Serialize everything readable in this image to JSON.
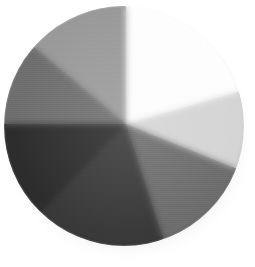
{
  "image": {
    "title": "Conical gradient disc",
    "description": "A circular disc filled with an angular (conic) gradient made of seven gray sectors converging at a point slightly above and left of center, with a soft drop shadow.",
    "background_color": "#ffffff",
    "width": 255,
    "height": 267
  },
  "disc": {
    "label": "gradient-disc",
    "center_x": 126,
    "center_y": 124,
    "radius": 120,
    "shadow_color": "#4b4b4b",
    "rim_label": "disc rim highlight",
    "sheen_label": "disc radial sheen",
    "texture_label": "scanline texture"
  },
  "chart_data": {
    "type": "pie",
    "title": "Conical gradient disc",
    "subtitle": "",
    "xlabel": "",
    "ylabel": "",
    "legend_position": "none",
    "grid": false,
    "center": [
      126,
      124
    ],
    "radius": 120,
    "categories": [
      "upper-right highlight",
      "right light",
      "lower-right mid",
      "bottom dark",
      "lower-left darkest",
      "left dark",
      "upper-left mid"
    ],
    "values": [
      52,
      46,
      58,
      62,
      46,
      40,
      56
    ],
    "start_angles_deg": [
      -68,
      -16,
      22,
      72,
      134,
      180,
      220
    ],
    "end_angles_deg": [
      -16,
      22,
      72,
      134,
      180,
      220,
      292
    ],
    "colors": [
      "#fdfdfd",
      "#d5d5d5",
      "#6e6e6e",
      "#3a3a3a",
      "#2d2d2d",
      "#6f6f6f",
      "#9a9a9a"
    ],
    "sector_hex_stops": [
      "#9a9a9a",
      "#a8a8a8",
      "#f4f4f4",
      "#fdfdfd",
      "#ededed",
      "#d5d5d5",
      "#b9b9b9",
      "#6e6e6e",
      "#5e5e5e",
      "#3a3a3a",
      "#333333",
      "#2d2d2d",
      "#4a4a4a",
      "#6f6f6f",
      "#8a8a8a",
      "#9a9a9a"
    ]
  }
}
